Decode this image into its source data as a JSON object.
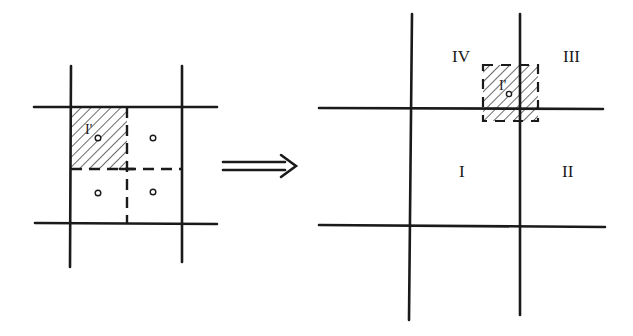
{
  "diagram": {
    "left_panel": {
      "description": "Single cell subdivided into four sub-cells; upper-left sub-cell shaded",
      "shaded_cell_label": "I'",
      "sub_cell_centers": 4
    },
    "arrow": {
      "direction": "right",
      "style": "double-line"
    },
    "right_panel": {
      "description": "Shaded cell shifted onto grid node, overlapping four cells",
      "quadrant_labels": [
        "IV",
        "III",
        "I",
        "II"
      ],
      "shaded_cell_label": "I'"
    },
    "colors": {
      "stroke": "#1a1a1a",
      "background": "#ffffff"
    }
  }
}
